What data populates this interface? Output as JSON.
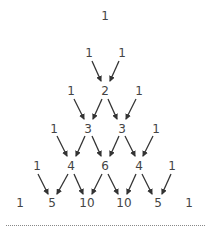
{
  "diagram": {
    "rows": [
      [
        "1"
      ],
      [
        "1",
        "1"
      ],
      [
        "1",
        "2",
        "1"
      ],
      [
        "1",
        "3",
        "3",
        "1"
      ],
      [
        "1",
        "4",
        "6",
        "4",
        "1"
      ],
      [
        "1",
        "5",
        "10",
        "10",
        "5",
        "1"
      ]
    ],
    "colors": {
      "text": "#444444",
      "arrow": "#333333",
      "divider": "#888888"
    }
  }
}
